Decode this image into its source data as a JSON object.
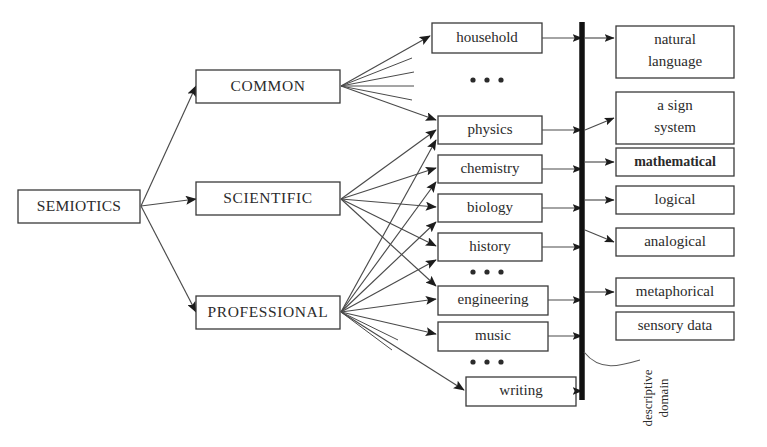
{
  "diagram": {
    "root": {
      "label": "SEMIOTICS",
      "x": 18,
      "y": 190,
      "w": 122,
      "h": 33
    },
    "categories": [
      {
        "id": "common",
        "label": "COMMON",
        "x": 196,
        "y": 70,
        "w": 144,
        "h": 33
      },
      {
        "id": "scientific",
        "label": "SCIENTIFIC",
        "x": 196,
        "y": 182,
        "w": 144,
        "h": 33
      },
      {
        "id": "professional",
        "label": "PROFESSIONAL",
        "x": 196,
        "y": 296,
        "w": 144,
        "h": 33
      }
    ],
    "domains": [
      {
        "id": "household",
        "label": "household",
        "x": 432,
        "y": 23,
        "w": 110,
        "h": 30
      },
      {
        "id": "physics",
        "label": "physics",
        "x": 438,
        "y": 116,
        "w": 104,
        "h": 28
      },
      {
        "id": "chemistry",
        "label": "chemistry",
        "x": 438,
        "y": 155,
        "w": 104,
        "h": 28
      },
      {
        "id": "biology",
        "label": "biology",
        "x": 438,
        "y": 194,
        "w": 104,
        "h": 28
      },
      {
        "id": "history",
        "label": "history",
        "x": 438,
        "y": 233,
        "w": 104,
        "h": 28
      },
      {
        "id": "engineering",
        "label": "engineering",
        "x": 438,
        "y": 286,
        "w": 110,
        "h": 29
      },
      {
        "id": "music",
        "label": "music",
        "x": 438,
        "y": 322,
        "w": 110,
        "h": 29
      },
      {
        "id": "writing",
        "label": "writing",
        "x": 466,
        "y": 377,
        "w": 110,
        "h": 29
      }
    ],
    "domain_ellipses": [
      {
        "id": "ellipsis-common",
        "cx": 487,
        "cy": 80
      },
      {
        "id": "ellipsis-scientific",
        "cx": 487,
        "cy": 272
      },
      {
        "id": "ellipsis-professional",
        "cx": 487,
        "cy": 362
      }
    ],
    "targets": [
      {
        "id": "natural-language",
        "label": "natural\nlanguage",
        "line1": "natural",
        "line2": "language",
        "x": 616,
        "y": 26,
        "w": 118,
        "h": 52,
        "bold": false,
        "arrow": true
      },
      {
        "id": "a-sign-system",
        "label": "a sign\nsystem",
        "line1": "a sign",
        "line2": "system",
        "x": 616,
        "y": 92,
        "w": 118,
        "h": 52,
        "bold": false,
        "arrow": true
      },
      {
        "id": "mathematical",
        "label": "mathematical",
        "line1": "mathematical",
        "line2": "",
        "x": 616,
        "y": 148,
        "w": 118,
        "h": 28,
        "bold": true,
        "arrow": true
      },
      {
        "id": "logical",
        "label": "logical",
        "line1": "logical",
        "line2": "",
        "x": 616,
        "y": 186,
        "w": 118,
        "h": 28,
        "bold": false,
        "arrow": true
      },
      {
        "id": "analogical",
        "label": "analogical",
        "line1": "analogical",
        "line2": "",
        "x": 616,
        "y": 228,
        "w": 118,
        "h": 28,
        "bold": false,
        "arrow": true
      },
      {
        "id": "metaphorical",
        "label": "metaphorical",
        "line1": "metaphorical",
        "line2": "",
        "x": 616,
        "y": 278,
        "w": 118,
        "h": 28,
        "bold": false,
        "arrow": true
      },
      {
        "id": "sensory-data",
        "label": "sensory data",
        "line1": "sensory data",
        "line2": "",
        "x": 616,
        "y": 312,
        "w": 118,
        "h": 28,
        "bold": false,
        "arrow": false
      }
    ],
    "spine": {
      "x": 582,
      "y_top": 22,
      "y_bottom": 400,
      "label_line1": "descriptive",
      "label_line2": "domain"
    },
    "annotation": {
      "id": "descriptive-domain",
      "text": "descriptive domain",
      "line1": "descriptive",
      "line2": "domain"
    },
    "colors": {
      "background": "#ffffff",
      "box_stroke": "#3a3a3a",
      "text": "#2b2b2b",
      "edge": "#4a4a4a",
      "spine": "#111111"
    }
  }
}
